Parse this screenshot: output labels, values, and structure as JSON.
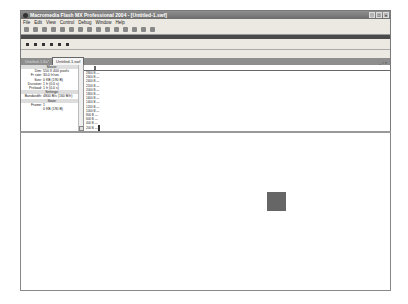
{
  "window": {
    "title": "Macromedia Flash MX Professional 2004 - [Untitled-1.swf]",
    "controls": {
      "minimize": "_",
      "maximize": "□",
      "close": "×"
    }
  },
  "menu": [
    "File",
    "Edit",
    "View",
    "Control",
    "Debug",
    "Window",
    "Help"
  ],
  "toolbar": {
    "icons": [
      "new-icon",
      "open-icon",
      "save-icon",
      "print-icon",
      "cut-icon",
      "copy-icon",
      "paste-icon",
      "undo-icon",
      "redo-icon",
      "snap-icon",
      "smooth-icon",
      "straighten-icon",
      "rotate-icon",
      "scale-icon",
      "align-icon"
    ]
  },
  "controller": {
    "icons": [
      "stop-icon",
      "rewind-icon",
      "step-back-icon",
      "play-icon",
      "step-forward-icon",
      "go-to-end-icon"
    ]
  },
  "tabs": [
    {
      "label": "Untitled-1.fla*",
      "active": false
    },
    {
      "label": "Untitled-1.swf",
      "active": true
    }
  ],
  "tab_controls": "_ ▫ ×",
  "profiler": {
    "movie_header": "Movie:",
    "movie": [
      {
        "k": "Dim:",
        "v": "550 X 400 pixels"
      },
      {
        "k": "Fr rate:",
        "v": "30.0 fr/sec"
      },
      {
        "k": "Size:",
        "v": "0 KB (190 B)"
      },
      {
        "k": "Duration:",
        "v": "1 fr (0.0 s)"
      },
      {
        "k": "Preload:",
        "v": "1 fr (0.0 s)"
      }
    ],
    "settings_header": "Settings:",
    "settings": [
      {
        "k": "Bandwidth:",
        "v": "4800 B/s (160 B/fr)"
      }
    ],
    "state_header": "State:",
    "state": [
      {
        "k": "Frame:",
        "v": "1"
      },
      {
        "k": "",
        "v": "0 KB (190 B)"
      }
    ],
    "y_labels": [
      "3600 B",
      "3400 B",
      "3200 B",
      "3000 B",
      "2800 B",
      "2600 B",
      "2400 B",
      "2200 B",
      "2000 B",
      "1800 B",
      "1600 B",
      "1400 B",
      "1200 B",
      "1000 B",
      "800 B",
      "600 B",
      "400 B",
      "200 B"
    ]
  },
  "stage": {
    "square": {
      "left": 246,
      "top": 59,
      "size": 19,
      "color": "#666666"
    }
  }
}
